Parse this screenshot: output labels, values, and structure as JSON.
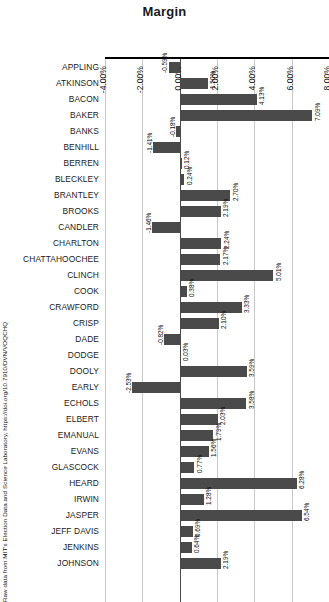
{
  "chart_data": {
    "type": "bar",
    "orientation": "horizontal",
    "title": "Margin",
    "xlabel": "",
    "ylabel": "",
    "xlim": [
      -4.0,
      8.0
    ],
    "xticks": [
      "-4.00%",
      "-2.00%",
      "0.00%",
      "2.00%",
      "4.00%",
      "6.00%",
      "8.00%"
    ],
    "xtick_values": [
      -4,
      -2,
      0,
      2,
      4,
      6,
      8
    ],
    "grid": true,
    "legend": null,
    "bar_color": "#4a4a4a",
    "categories": [
      "APPLING",
      "ATKINSON",
      "BACON",
      "BAKER",
      "BANKS",
      "BENHILL",
      "BERREN",
      "BLECKLEY",
      "BRANTLEY",
      "BROOKS",
      "CANDLER",
      "CHARLTON",
      "CHATTAHOOCHEE",
      "CLINCH",
      "COOK",
      "CRAWFORD",
      "CRISP",
      "DADE",
      "DODGE",
      "DOOLY",
      "EARLY",
      "ECHOLS",
      "ELBERT",
      "EMANUAL",
      "EVANS",
      "GLASCOCK",
      "HEARD",
      "IRWIN",
      "JASPER",
      "JEFF DAVIS",
      "JENKINS",
      "JOHNSON"
    ],
    "values": [
      -0.59,
      1.5,
      4.13,
      7.09,
      -0.18,
      -1.41,
      0.12,
      0.24,
      2.7,
      2.19,
      -1.46,
      2.24,
      2.17,
      5.01,
      0.38,
      3.33,
      2.1,
      -0.82,
      0.03,
      3.59,
      -2.53,
      3.58,
      2.03,
      1.79,
      1.56,
      0.77,
      6.28,
      1.28,
      6.54,
      0.69,
      0.64,
      2.19
    ],
    "value_labels": [
      "-0.59%",
      "1.50%",
      "4.13%",
      "7.09%",
      "-0.18%",
      "-1.41%",
      "0.12%",
      "0.24%",
      "2.70%",
      "2.19%",
      "-1.46%",
      "2.24%",
      "2.17%",
      "5.01%",
      "0.38%",
      "3.33%",
      "2.10%",
      "-0.82%",
      "0.03%",
      "3.59%",
      "-2.53%",
      "3.58%",
      "2.03%",
      "1.79%",
      "1.56%",
      "0.77%",
      "6.28%",
      "1.28%",
      "6.54%",
      "0.69%",
      "0.64%",
      "2.19%"
    ]
  },
  "source": {
    "caption": "Raw data from MIT's Election Data and Science Laboratory, https://doi.org/10.7910/DVN/VOQCHQ"
  }
}
